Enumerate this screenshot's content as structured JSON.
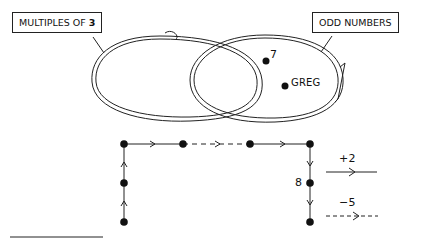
{
  "venn": {
    "left_set_label": "MULTIPLES OF",
    "left_set_number": "3",
    "right_set_label": "ODD NUMBERS",
    "points": [
      {
        "label": "7"
      },
      {
        "label": "GREG"
      }
    ]
  },
  "graph": {
    "node_label_8": "8",
    "legend": [
      {
        "label": "+2",
        "style": "solid"
      },
      {
        "label": "−5",
        "style": "dashed"
      }
    ]
  },
  "colors": {
    "ink": "#111111",
    "background": "#ffffff"
  }
}
